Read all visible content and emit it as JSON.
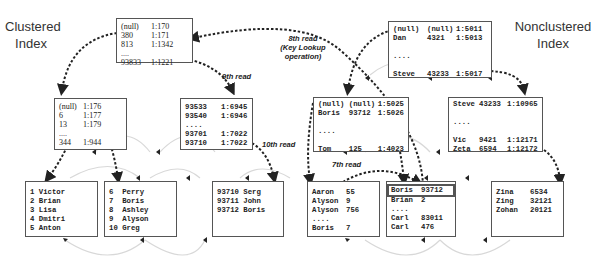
{
  "titles": {
    "clustered": [
      "Clustered",
      "Index"
    ],
    "nonclustered": [
      "Nonclustered",
      "Index"
    ]
  },
  "clustered": {
    "root": {
      "rows": [
        [
          "(null)",
          "1:170"
        ],
        [
          "380",
          "1:171"
        ],
        [
          "813",
          "1:1342"
        ],
        [
          "....",
          ""
        ],
        [
          "93833",
          "1:1221"
        ]
      ]
    },
    "intermediate_left": {
      "rows": [
        [
          "(null)",
          "1:176"
        ],
        [
          "6",
          "1:177"
        ],
        [
          "13",
          "1:179"
        ],
        [
          "....",
          ""
        ],
        [
          "344",
          "1:944"
        ]
      ]
    },
    "intermediate_right": {
      "rows": [
        [
          "93533",
          "1:6945"
        ],
        [
          "93540",
          "1:6946"
        ],
        [
          "....",
          ""
        ],
        [
          "93701",
          "1:7022"
        ],
        [
          "93710",
          "1:7022"
        ]
      ]
    },
    "leaf_1": {
      "rows": [
        [
          "1 Victor"
        ],
        [
          "2 Brian"
        ],
        [
          "3 Lisa"
        ],
        [
          "4 Dmitri"
        ],
        [
          "5 Anton"
        ]
      ]
    },
    "leaf_2": {
      "rows": [
        [
          "6  Perry"
        ],
        [
          "7  Boris"
        ],
        [
          "8  Ashley"
        ],
        [
          "9  Alyson"
        ],
        [
          "10 Greg"
        ]
      ]
    },
    "leaf_3": {
      "rows": [
        [
          "93710 Serg"
        ],
        [
          "93711 John"
        ],
        [
          "93712 Boris"
        ]
      ]
    }
  },
  "nonclustered": {
    "root": {
      "rows": [
        [
          "(null)",
          "(null)",
          "1:5011"
        ],
        [
          "Dan",
          "4321",
          "1:5013"
        ],
        [
          "",
          "",
          ""
        ],
        [
          "....",
          "",
          ""
        ],
        [
          "",
          "",
          ""
        ],
        [
          "Steve",
          "43233",
          "1:5017"
        ]
      ]
    },
    "intermediate_left": {
      "rows": [
        [
          "(null)",
          "(null)",
          "1:5025"
        ],
        [
          "Boris",
          "93712",
          "1:5026"
        ],
        [
          "",
          "",
          ""
        ],
        [
          "....",
          "",
          ""
        ],
        [
          "",
          "",
          ""
        ],
        [
          "Tom",
          "125",
          "1:4023"
        ]
      ]
    },
    "intermediate_right": {
      "rows": [
        [
          "Steve",
          "43233",
          "1:10965"
        ],
        [
          "",
          "",
          ""
        ],
        [
          "....",
          "",
          ""
        ],
        [
          "",
          "",
          ""
        ],
        [
          "Vic",
          "9421",
          "1:12171"
        ],
        [
          "Zeta",
          "6594",
          "1:12172"
        ]
      ]
    },
    "leaf_1": {
      "rows": [
        [
          "Aaron",
          "55"
        ],
        [
          "Alyson",
          "9"
        ],
        [
          "Alyson",
          "756"
        ],
        [
          "....",
          ""
        ],
        [
          "Boris",
          "7"
        ]
      ]
    },
    "leaf_2": {
      "rows": [
        [
          "Boris",
          "93712"
        ],
        [
          "Brian",
          "2"
        ],
        [
          "....",
          ""
        ],
        [
          "Carl",
          "83011"
        ],
        [
          "Carl",
          "476"
        ]
      ],
      "highlighted_row": 0
    },
    "leaf_3": {
      "rows": [
        [
          "Zina",
          "6534"
        ],
        [
          "Zing",
          "32121"
        ],
        [
          "Zohan",
          "20121"
        ]
      ]
    }
  },
  "annotations": {
    "read_7": "7th read",
    "read_8": "8th read",
    "read_8_sub1": "(Key Lookup",
    "read_8_sub2": "operation)",
    "read_9": "9th read",
    "read_10": "10th read"
  }
}
